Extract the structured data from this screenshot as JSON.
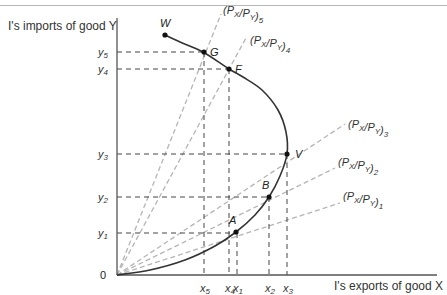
{
  "chart_data": {
    "type": "line",
    "title": "",
    "xlabel": "I's exports of good X",
    "ylabel": "I's imports of good Y",
    "origin_label": "0",
    "axes": {
      "origin_px": [
        117,
        275
      ],
      "x_end_px": 437,
      "y_top_px": 18
    },
    "x_ticks": [
      {
        "label": "x",
        "sub": "5",
        "px": 204
      },
      {
        "label": "x",
        "sub": "4",
        "px": 229
      },
      {
        "label": "x",
        "sub": "1",
        "px": 237
      },
      {
        "label": "x",
        "sub": "2",
        "px": 269
      },
      {
        "label": "x",
        "sub": "3",
        "px": 287
      }
    ],
    "y_ticks": [
      {
        "label": "y",
        "sub": "5",
        "px": 52
      },
      {
        "label": "y",
        "sub": "4",
        "px": 69
      },
      {
        "label": "y",
        "sub": "3",
        "px": 154
      },
      {
        "label": "y",
        "sub": "2",
        "px": 197
      },
      {
        "label": "y",
        "sub": "1",
        "px": 233
      }
    ],
    "offer_curve": {
      "name": "Offer curve 0W",
      "points_px": [
        [
          117,
          275
        ],
        [
          150,
          270
        ],
        [
          185,
          260
        ],
        [
          215,
          246
        ],
        [
          236,
          232
        ],
        [
          255,
          215
        ],
        [
          269,
          197
        ],
        [
          280,
          176
        ],
        [
          287,
          154
        ],
        [
          286,
          132
        ],
        [
          278,
          110
        ],
        [
          262,
          90
        ],
        [
          243,
          77
        ],
        [
          229,
          69
        ],
        [
          203,
          52
        ],
        [
          180,
          42
        ],
        [
          165,
          35
        ]
      ]
    },
    "labeled_points": [
      {
        "name": "W",
        "x": 165,
        "y": 35,
        "lx": 160,
        "ly": 27
      },
      {
        "name": "G",
        "x": 204,
        "y": 52,
        "lx": 210,
        "ly": 56
      },
      {
        "name": "F",
        "x": 229,
        "y": 69,
        "lx": 235,
        "ly": 73
      },
      {
        "name": "V",
        "x": 287,
        "y": 154,
        "lx": 295,
        "ly": 158
      },
      {
        "name": "B",
        "x": 269,
        "y": 197,
        "lx": 262,
        "ly": 189
      },
      {
        "name": "A",
        "x": 236,
        "y": 232,
        "lx": 229,
        "ly": 224
      }
    ],
    "price_rays": [
      {
        "label": "(P",
        "x_sub": "X",
        "mid": "/P",
        "y_sub": "Y",
        "idx": "5",
        "end": [
          221,
          14
        ],
        "lx": 223,
        "ly": 14
      },
      {
        "label": "(P",
        "x_sub": "X",
        "mid": "/P",
        "y_sub": "Y",
        "idx": "4",
        "end": [
          246,
          38
        ],
        "lx": 250,
        "ly": 44
      },
      {
        "label": "(P",
        "x_sub": "X",
        "mid": "/P",
        "y_sub": "Y",
        "idx": "3",
        "end": [
          345,
          124
        ],
        "lx": 348,
        "ly": 128
      },
      {
        "label": "(P",
        "x_sub": "X",
        "mid": "/P",
        "y_sub": "Y",
        "idx": "2",
        "end": [
          335,
          168
        ],
        "lx": 338,
        "ly": 166
      },
      {
        "label": "(P",
        "x_sub": "X",
        "mid": "/P",
        "y_sub": "Y",
        "idx": "1",
        "end": [
          340,
          203
        ],
        "lx": 343,
        "ly": 200
      }
    ]
  }
}
